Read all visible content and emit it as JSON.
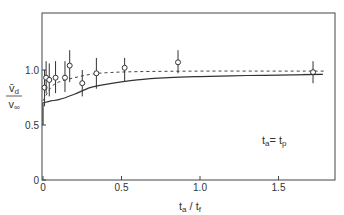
{
  "chart_data": {
    "type": "scatter",
    "title": "",
    "xlabel": "t_a / t_f",
    "ylabel": "v̄_d / v_∞",
    "xlim": [
      -0.03,
      1.9
    ],
    "ylim": [
      0,
      1.52
    ],
    "xticks": [
      0,
      0.5,
      1.0,
      1.5
    ],
    "xtick_labels": [
      "0",
      "0.5",
      "1.0",
      "1.5"
    ],
    "yticks": [
      0,
      0.5,
      1.0
    ],
    "ytick_labels": [
      "0",
      "0.5",
      "1.0"
    ],
    "grid": false,
    "legend": null,
    "annotation": "t_a = t_p",
    "series": [
      {
        "name": "measured",
        "style": "open-circle with error bars",
        "x": [
          0.01,
          0.02,
          0.04,
          0.08,
          0.14,
          0.17,
          0.25,
          0.34,
          0.52,
          0.86,
          1.72
        ],
        "y": [
          0.84,
          0.93,
          0.91,
          0.93,
          0.93,
          1.04,
          0.88,
          0.97,
          1.02,
          1.07,
          0.98
        ],
        "err_low": [
          0.67,
          0.79,
          0.76,
          0.79,
          0.8,
          0.89,
          0.76,
          0.83,
          0.9,
          0.97,
          0.88
        ],
        "err_high": [
          1.0,
          1.08,
          1.06,
          1.08,
          1.08,
          1.18,
          1.0,
          1.11,
          1.11,
          1.18,
          1.08
        ]
      },
      {
        "name": "theory-dashed",
        "style": "dashed line",
        "x": [
          0.0,
          0.05,
          0.1,
          0.2,
          0.3,
          0.4,
          0.6,
          1.0,
          1.5,
          1.8
        ],
        "y": [
          0.72,
          0.84,
          0.89,
          0.93,
          0.96,
          0.975,
          0.985,
          0.99,
          0.99,
          0.99
        ]
      },
      {
        "name": "theory-solid",
        "style": "solid line",
        "x": [
          0.0,
          0.05,
          0.1,
          0.2,
          0.3,
          0.4,
          0.6,
          0.8,
          1.0,
          1.3,
          1.6,
          1.78
        ],
        "y": [
          0.7,
          0.72,
          0.73,
          0.78,
          0.84,
          0.87,
          0.91,
          0.93,
          0.94,
          0.95,
          0.955,
          0.96
        ]
      }
    ]
  }
}
